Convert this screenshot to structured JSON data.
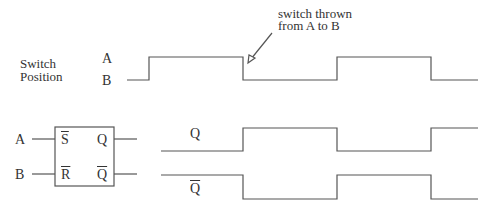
{
  "labels": {
    "switch_position_line1": "Switch",
    "switch_position_line2": "Position",
    "level_a": "A",
    "level_b": "B",
    "annotation_line1": "switch thrown",
    "annotation_line2": "from A to B",
    "input_a": "A",
    "input_b": "B",
    "pin_s": "S",
    "pin_r": "R",
    "pin_q": "Q",
    "pin_qbar": "Q",
    "wave_q": "Q",
    "wave_qbar": "Q"
  },
  "waveforms": {
    "switch": {
      "levels": [
        "B",
        "A",
        "B",
        "A",
        "B"
      ],
      "transitions_x": [
        149,
        243,
        337,
        431
      ]
    },
    "q": {
      "levels": [
        "low",
        "high",
        "low",
        "high"
      ],
      "transitions_x": [
        243,
        337,
        431
      ]
    },
    "qbar": {
      "levels": [
        "high",
        "low",
        "high",
        "low"
      ],
      "transitions_x": [
        243,
        337,
        431
      ]
    }
  },
  "colors": {
    "line": "#555555",
    "text": "#333333"
  }
}
